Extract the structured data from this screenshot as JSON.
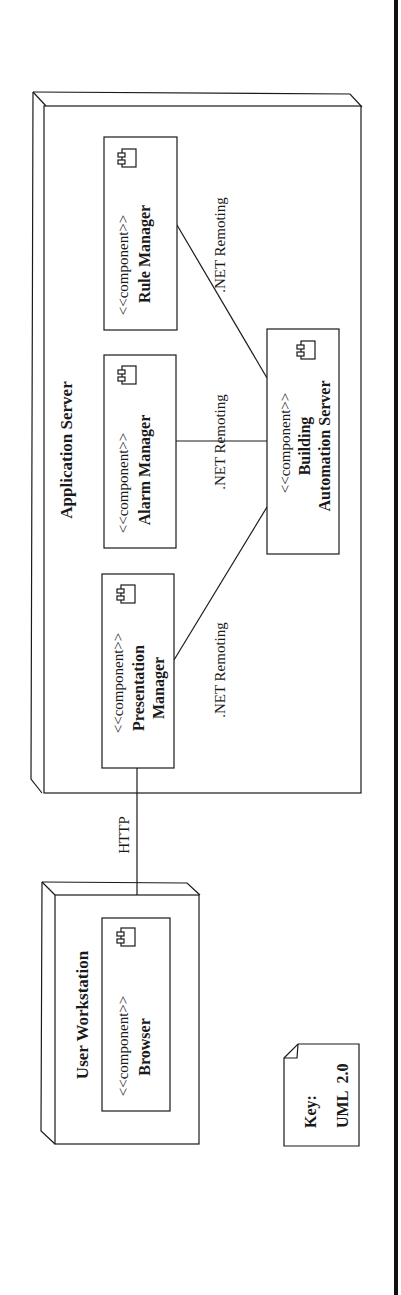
{
  "diagram": {
    "type": "UML 2.0 deployment diagram",
    "orientation": "rotated 90deg counter-clockwise",
    "nodes": {
      "app_server": {
        "title": "Application Server"
      },
      "workstation": {
        "title": "User Workstation"
      }
    },
    "components": {
      "rule_manager": {
        "stereotype": "<<component>>",
        "name_line1": "Rule Manager"
      },
      "alarm_manager": {
        "stereotype": "<<component>>",
        "name_line1": "Alarm Manager"
      },
      "presentation_manager": {
        "stereotype": "<<component>>",
        "name_line1": "Presentation",
        "name_line2": "Manager"
      },
      "building_automation_server": {
        "stereotype": "<<component>>",
        "name_line1": "Building",
        "name_line2": "Automation Server"
      },
      "browser": {
        "stereotype": "<<component>>",
        "name_line1": "Browser"
      }
    },
    "connectors": {
      "rule_to_bas": {
        "label": ".NET Remoting"
      },
      "alarm_to_bas": {
        "label": ".NET Remoting"
      },
      "presentation_to_bas": {
        "label": ".NET Remoting"
      },
      "browser_to_presentation": {
        "label": "HTTP"
      }
    },
    "key": {
      "line1": "Key:",
      "line2": "UML  2.0"
    },
    "colors": {
      "stroke": "#1a1a1a",
      "background": "#ffffff",
      "frame_bar": "#111111"
    }
  }
}
